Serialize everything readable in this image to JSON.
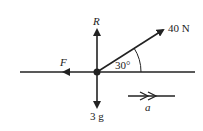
{
  "diagram": {
    "forces": {
      "reaction": "R",
      "applied": "40 N",
      "friction": "F",
      "weight": "3 g"
    },
    "angle_label": "30°",
    "acceleration_label": "a",
    "colors": {
      "ink": "#222222",
      "background": "#ffffff"
    }
  }
}
